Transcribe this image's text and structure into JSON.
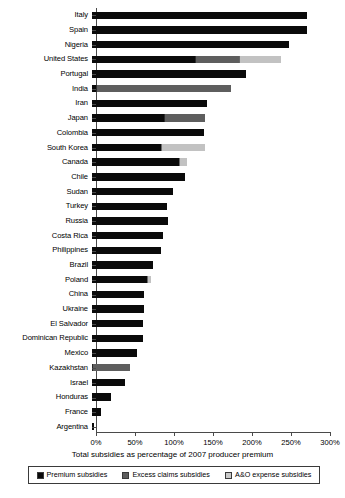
{
  "chart_data": {
    "type": "bar",
    "orientation": "horizontal",
    "stacked": true,
    "title": "",
    "xlabel": "Total subsidies as percentage of 2007 producer premium",
    "ylabel": "",
    "xlim": [
      0,
      300
    ],
    "xticks": [
      "0%",
      "50%",
      "100%",
      "150%",
      "200%",
      "250%",
      "300%"
    ],
    "xtick_values": [
      0,
      50,
      100,
      150,
      200,
      250,
      300
    ],
    "grid": false,
    "legend_position": "bottom",
    "series": [
      {
        "name": "Premium subsidies",
        "color": "#0a0a0a",
        "key": "premium"
      },
      {
        "name": "Excess claims subsidies",
        "color": "#5e5e5e",
        "key": "excess"
      },
      {
        "name": "A&O expense subsidies",
        "color": "#c9c9c9",
        "key": "ao"
      }
    ],
    "categories": [
      "Italy",
      "Spain",
      "Nigeria",
      "United States",
      "Portugal",
      "India",
      "Iran",
      "Japan",
      "Colombia",
      "South Korea",
      "Canada",
      "Chile",
      "Sudan",
      "Turkey",
      "Russia",
      "Costa Rica",
      "Philippines",
      "Brazil",
      "Poland",
      "China",
      "Ukraine",
      "El Salvador",
      "Dominican Republic",
      "Mexico",
      "Kazakhstan",
      "Israel",
      "Honduras",
      "France",
      "Argentina"
    ],
    "rows": [
      {
        "label": "Italy",
        "premium": 276,
        "excess": 0,
        "ao": 0,
        "total": 276
      },
      {
        "label": "Spain",
        "premium": 276,
        "excess": 0,
        "ao": 0,
        "total": 276
      },
      {
        "label": "Nigeria",
        "premium": 252,
        "excess": 0,
        "ao": 0,
        "total": 252
      },
      {
        "label": "United States",
        "premium": 132,
        "excess": 55,
        "ao": 53,
        "total": 240
      },
      {
        "label": "Portugal",
        "premium": 197,
        "excess": 0,
        "ao": 0,
        "total": 197
      },
      {
        "label": "India",
        "premium": 5,
        "excess": 172,
        "ao": 0,
        "total": 177
      },
      {
        "label": "Iran",
        "premium": 148,
        "excess": 0,
        "ao": 0,
        "total": 148
      },
      {
        "label": "Japan",
        "premium": 92,
        "excess": 51,
        "ao": 0,
        "total": 143
      },
      {
        "label": "Colombia",
        "premium": 143,
        "excess": 0,
        "ao": 0,
        "total": 143
      },
      {
        "label": "South Korea",
        "premium": 88,
        "excess": 0,
        "ao": 55,
        "total": 143
      },
      {
        "label": "Canada",
        "premium": 112,
        "excess": 0,
        "ao": 9,
        "total": 121
      },
      {
        "label": "Chile",
        "premium": 119,
        "excess": 0,
        "ao": 0,
        "total": 119
      },
      {
        "label": "Sudan",
        "premium": 104,
        "excess": 0,
        "ao": 0,
        "total": 104
      },
      {
        "label": "Turkey",
        "premium": 96,
        "excess": 0,
        "ao": 0,
        "total": 96
      },
      {
        "label": "Russia",
        "premium": 97,
        "excess": 0,
        "ao": 0,
        "total": 97
      },
      {
        "label": "Costa Rica",
        "premium": 91,
        "excess": 0,
        "ao": 0,
        "total": 91
      },
      {
        "label": "Philippines",
        "premium": 88,
        "excess": 0,
        "ao": 0,
        "total": 88
      },
      {
        "label": "Brazil",
        "premium": 78,
        "excess": 0,
        "ao": 0,
        "total": 78
      },
      {
        "label": "Poland",
        "premium": 70,
        "excess": 0,
        "ao": 4,
        "total": 74
      },
      {
        "label": "China",
        "premium": 67,
        "excess": 0,
        "ao": 0,
        "total": 67
      },
      {
        "label": "Ukraine",
        "premium": 67,
        "excess": 0,
        "ao": 0,
        "total": 67
      },
      {
        "label": "El Salvador",
        "premium": 66,
        "excess": 0,
        "ao": 0,
        "total": 66
      },
      {
        "label": "Dominican Republic",
        "premium": 66,
        "excess": 0,
        "ao": 0,
        "total": 66
      },
      {
        "label": "Mexico",
        "premium": 58,
        "excess": 0,
        "ao": 0,
        "total": 58
      },
      {
        "label": "Kazakhstan",
        "premium": 0,
        "excess": 48,
        "ao": 0,
        "total": 48
      },
      {
        "label": "Israel",
        "premium": 42,
        "excess": 0,
        "ao": 0,
        "total": 42
      },
      {
        "label": "Honduras",
        "premium": 24,
        "excess": 0,
        "ao": 0,
        "total": 24
      },
      {
        "label": "France",
        "premium": 11,
        "excess": 0,
        "ao": 0,
        "total": 11
      },
      {
        "label": "Argentina",
        "premium": 2,
        "excess": 0,
        "ao": 0,
        "total": 2
      }
    ]
  },
  "legend": {
    "items": [
      {
        "label": "Premium subsidies",
        "key": "premium"
      },
      {
        "label": "Excess claims subsidies",
        "key": "excess"
      },
      {
        "label": "A&O expense subsidies",
        "key": "ao"
      }
    ]
  },
  "axis": {
    "title": "Total subsidies as percentage of 2007 producer premium"
  }
}
